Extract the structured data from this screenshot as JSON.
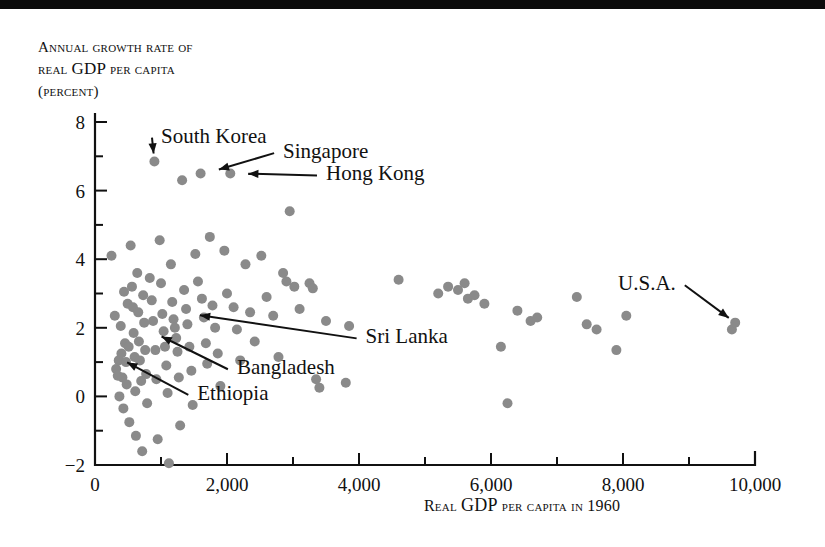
{
  "figure": {
    "name": "gdp-growth-vs-initial-gdp-scatter",
    "y_axis_caption_line1": "Annual growth rate of",
    "y_axis_caption_line2_pre": "real ",
    "y_axis_caption_line2_big": "GDP",
    "y_axis_caption_line2_post": " per capita",
    "y_axis_caption_line3": "(percent)",
    "x_axis_caption_pre": "Real ",
    "x_axis_caption_big": "GDP",
    "x_axis_caption_post": " per capita in 1960"
  },
  "chart_data": {
    "type": "scatter",
    "title": "",
    "xlabel": "Real GDP per capita in 1960",
    "ylabel": "Annual growth rate of real GDP per capita (percent)",
    "xlim": [
      0,
      10000
    ],
    "ylim": [
      -2,
      8
    ],
    "grid": false,
    "legend": "none",
    "xticks_major": [
      0,
      2000,
      4000,
      6000,
      8000,
      10000
    ],
    "xticks_major_labels": [
      "0",
      "2,000",
      "4,000",
      "6,000",
      "8,000",
      "10,000"
    ],
    "xticks_minor": [
      1000,
      3000,
      5000,
      7000,
      9000
    ],
    "yticks_major": [
      -2,
      0,
      2,
      4,
      6,
      8
    ],
    "yticks_major_labels": [
      "−2",
      "0",
      "2",
      "4",
      "6",
      "8"
    ],
    "yticks_minor": [
      -1,
      1,
      3,
      5,
      7
    ],
    "marker": {
      "shape": "circle",
      "color": "#8a8a8a",
      "size_px": 10
    },
    "points": [
      [
        250,
        4.1
      ],
      [
        300,
        2.35
      ],
      [
        320,
        0.8
      ],
      [
        345,
        0.6
      ],
      [
        360,
        1.05
      ],
      [
        370,
        0.0
      ],
      [
        390,
        2.05
      ],
      [
        400,
        1.25
      ],
      [
        415,
        0.55
      ],
      [
        430,
        -0.35
      ],
      [
        440,
        3.05
      ],
      [
        455,
        1.55
      ],
      [
        470,
        1.0
      ],
      [
        480,
        0.35
      ],
      [
        495,
        2.7
      ],
      [
        510,
        1.45
      ],
      [
        520,
        -0.75
      ],
      [
        540,
        4.4
      ],
      [
        560,
        3.2
      ],
      [
        575,
        2.6
      ],
      [
        585,
        1.85
      ],
      [
        600,
        1.15
      ],
      [
        610,
        0.15
      ],
      [
        620,
        -1.15
      ],
      [
        640,
        3.6
      ],
      [
        655,
        2.45
      ],
      [
        665,
        1.6
      ],
      [
        680,
        1.05
      ],
      [
        700,
        0.45
      ],
      [
        715,
        -1.6
      ],
      [
        730,
        2.95
      ],
      [
        745,
        2.15
      ],
      [
        760,
        1.35
      ],
      [
        775,
        0.65
      ],
      [
        790,
        -0.2
      ],
      [
        830,
        3.45
      ],
      [
        860,
        2.8
      ],
      [
        880,
        2.2
      ],
      [
        900,
        6.85
      ],
      [
        915,
        1.35
      ],
      [
        930,
        0.5
      ],
      [
        950,
        -1.25
      ],
      [
        980,
        4.55
      ],
      [
        1000,
        3.3
      ],
      [
        1020,
        2.4
      ],
      [
        1040,
        1.9
      ],
      [
        1060,
        1.45
      ],
      [
        1080,
        0.9
      ],
      [
        1100,
        0.1
      ],
      [
        1120,
        -1.95
      ],
      [
        1150,
        3.85
      ],
      [
        1170,
        2.75
      ],
      [
        1190,
        2.25
      ],
      [
        1210,
        2.0
      ],
      [
        1230,
        1.7
      ],
      [
        1250,
        1.3
      ],
      [
        1270,
        0.55
      ],
      [
        1290,
        -0.85
      ],
      [
        1320,
        6.3
      ],
      [
        1350,
        3.1
      ],
      [
        1380,
        2.55
      ],
      [
        1400,
        2.1
      ],
      [
        1430,
        1.45
      ],
      [
        1460,
        0.75
      ],
      [
        1480,
        -0.25
      ],
      [
        1520,
        4.15
      ],
      [
        1560,
        3.35
      ],
      [
        1600,
        6.5
      ],
      [
        1620,
        2.85
      ],
      [
        1650,
        2.3
      ],
      [
        1680,
        1.55
      ],
      [
        1700,
        0.95
      ],
      [
        1740,
        4.65
      ],
      [
        1780,
        2.65
      ],
      [
        1820,
        2.0
      ],
      [
        1860,
        1.25
      ],
      [
        1900,
        0.3
      ],
      [
        1960,
        4.25
      ],
      [
        2000,
        3.0
      ],
      [
        2050,
        6.5
      ],
      [
        2100,
        2.6
      ],
      [
        2150,
        1.95
      ],
      [
        2200,
        1.05
      ],
      [
        2280,
        3.85
      ],
      [
        2350,
        2.45
      ],
      [
        2420,
        1.6
      ],
      [
        2520,
        4.1
      ],
      [
        2600,
        2.9
      ],
      [
        2700,
        2.35
      ],
      [
        2780,
        1.15
      ],
      [
        2850,
        3.6
      ],
      [
        2900,
        3.35
      ],
      [
        2950,
        5.4
      ],
      [
        3020,
        3.2
      ],
      [
        3100,
        2.55
      ],
      [
        3250,
        3.3
      ],
      [
        3300,
        3.15
      ],
      [
        3350,
        0.5
      ],
      [
        3400,
        0.25
      ],
      [
        3500,
        2.2
      ],
      [
        3800,
        0.4
      ],
      [
        3850,
        2.05
      ],
      [
        4600,
        3.4
      ],
      [
        5200,
        3.0
      ],
      [
        5350,
        3.2
      ],
      [
        5500,
        3.1
      ],
      [
        5600,
        3.3
      ],
      [
        5650,
        2.85
      ],
      [
        5750,
        2.95
      ],
      [
        5900,
        2.7
      ],
      [
        6150,
        1.45
      ],
      [
        6250,
        -0.2
      ],
      [
        6400,
        2.5
      ],
      [
        6600,
        2.2
      ],
      [
        6700,
        2.3
      ],
      [
        7300,
        2.9
      ],
      [
        7450,
        2.1
      ],
      [
        7600,
        1.95
      ],
      [
        7900,
        1.35
      ],
      [
        8050,
        2.35
      ],
      [
        9650,
        1.95
      ],
      [
        9700,
        2.15
      ]
    ],
    "annotations": [
      {
        "label": "South Korea",
        "point": [
          900,
          6.85
        ],
        "label_x": 1000,
        "label_y": 7.6
      },
      {
        "label": "Singapore",
        "point": [
          1760,
          6.55
        ],
        "label_x": 2850,
        "label_y": 7.15
      },
      {
        "label": "Hong Kong",
        "point": [
          2200,
          6.5
        ],
        "label_x": 3500,
        "label_y": 6.5
      },
      {
        "label": "Sri Lanka",
        "point": [
          1470,
          2.4
        ],
        "label_x": 4100,
        "label_y": 1.75
      },
      {
        "label": "Bangladesh",
        "point": [
          900,
          1.85
        ],
        "label_x": 2150,
        "label_y": 0.85
      },
      {
        "label": "Ethiopia",
        "point": [
          380,
          1.1
        ],
        "label_x": 1550,
        "label_y": 0.1
      },
      {
        "label": "U.S.A.",
        "point": [
          9700,
          2.15
        ],
        "label_x": 8800,
        "label_y": 3.3
      }
    ]
  }
}
